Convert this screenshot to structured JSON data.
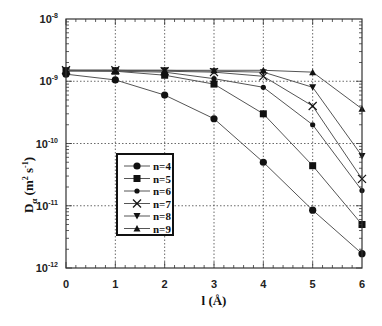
{
  "chart_data": {
    "type": "line",
    "title": "",
    "xlabel": "l (Å)",
    "ylabel": "D_α (m² s⁻¹)",
    "ylabel_parts": {
      "main": "D",
      "sub": "α",
      "unit_open": "(m",
      "unit_sup1": "2",
      "unit_mid": " s",
      "unit_sup2": "-1",
      "unit_close": ")"
    },
    "xlabel_parts": {
      "main": "l",
      "unit": "(Å)"
    },
    "x": [
      0,
      1,
      2,
      3,
      4,
      5,
      6
    ],
    "x_ticks": [
      "0",
      "1",
      "2",
      "3",
      "4",
      "5",
      "6"
    ],
    "xlim": [
      0,
      6
    ],
    "yscale": "log",
    "ylim": [
      1e-12,
      1e-08
    ],
    "y_ticks": [
      {
        "value": 1e-08,
        "base": "10",
        "exp": "-8"
      },
      {
        "value": 1e-09,
        "base": "10",
        "exp": "-9"
      },
      {
        "value": 1e-10,
        "base": "10",
        "exp": "-10"
      },
      {
        "value": 1e-11,
        "base": "10",
        "exp": "-11"
      },
      {
        "value": 1e-12,
        "base": "10",
        "exp": "-12"
      }
    ],
    "grid": true,
    "legend_position": "lower left (inside)",
    "series": [
      {
        "name": "n=4",
        "marker": "circle",
        "values": [
          1.3e-09,
          1.05e-09,
          6e-10,
          2.5e-10,
          5e-11,
          8.5e-12,
          1.7e-12
        ]
      },
      {
        "name": "n=5",
        "marker": "square",
        "values": [
          1.45e-09,
          1.45e-09,
          1.25e-09,
          9e-10,
          3e-10,
          4.4e-11,
          5e-12
        ]
      },
      {
        "name": "n=6",
        "marker": "small-circle",
        "values": [
          1.5e-09,
          1.45e-09,
          1.4e-09,
          1.1e-09,
          8e-10,
          2e-10,
          1.75e-11
        ]
      },
      {
        "name": "n=7",
        "marker": "x",
        "values": [
          1.5e-09,
          1.5e-09,
          1.45e-09,
          1.4e-09,
          1.2e-09,
          4e-10,
          2.7e-11
        ]
      },
      {
        "name": "n=8",
        "marker": "triangle-down",
        "values": [
          1.5e-09,
          1.5e-09,
          1.5e-09,
          1.45e-09,
          1.4e-09,
          8e-10,
          6.3e-11
        ]
      },
      {
        "name": "n=9",
        "marker": "triangle-up",
        "values": [
          1.5e-09,
          1.5e-09,
          1.5e-09,
          1.5e-09,
          1.5e-09,
          1.4e-09,
          3.6e-10
        ]
      }
    ]
  },
  "colors": {
    "line": "#555555",
    "marker": "#111111",
    "axis": "#333333",
    "grid": "#444444",
    "background": "#ffffff"
  }
}
